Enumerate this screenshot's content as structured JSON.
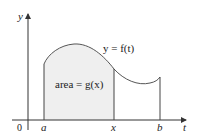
{
  "figure": {
    "axes": {
      "y_label": "y",
      "t_label": "t",
      "origin_label": "0"
    },
    "ticks": {
      "a": "a",
      "x": "x",
      "b": "b"
    },
    "curve_label": "y = f(t)",
    "area_label": "area = g(x)",
    "colors": {
      "shaded_area": "#efefef",
      "curve": "#555555",
      "axes": "#333333"
    }
  }
}
